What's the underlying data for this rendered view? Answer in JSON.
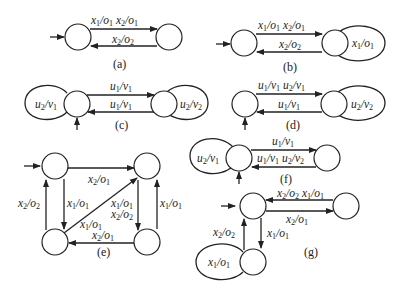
{
  "figure": {
    "subfigures": [
      {
        "id": "a",
        "caption": "(a)",
        "edges": [
          {
            "label": "x1/o1 x2/o1",
            "from": "s0",
            "to": "s1"
          },
          {
            "label": "x2/o2",
            "from": "s1",
            "to": "s0"
          }
        ]
      },
      {
        "id": "b",
        "caption": "(b)",
        "edges": [
          {
            "label": "x1/o1 x2/o1",
            "from": "s0",
            "to": "s1"
          },
          {
            "label": "x2/o2",
            "from": "s1",
            "to": "s0"
          },
          {
            "label": "x1/o1",
            "from": "s1",
            "to": "s1"
          }
        ]
      },
      {
        "id": "c",
        "caption": "(c)",
        "edges": [
          {
            "label": "u2/v1",
            "from": "s0",
            "to": "s0"
          },
          {
            "label": "u1/v1",
            "from": "s0",
            "to": "s1"
          },
          {
            "label": "u1/v1",
            "from": "s1",
            "to": "s0"
          },
          {
            "label": "u2/v2",
            "from": "s1",
            "to": "s1"
          }
        ]
      },
      {
        "id": "d",
        "caption": "(d)",
        "edges": [
          {
            "label": "u1/v1 u2/v1",
            "from": "s0",
            "to": "s1"
          },
          {
            "label": "u1/v1",
            "from": "s1",
            "to": "s0"
          },
          {
            "label": "u2/v2",
            "from": "s1",
            "to": "s1"
          }
        ]
      },
      {
        "id": "e",
        "caption": "(e)",
        "edges": [
          {
            "label": "x2/o1",
            "from": "tl",
            "to": "tr"
          },
          {
            "label": "x1/o1",
            "from": "tl",
            "to": "bl"
          },
          {
            "label": "x2/o2",
            "from": "bl",
            "to": "tl"
          },
          {
            "label": "x1/o1",
            "from": "bl",
            "to": "tr"
          },
          {
            "label": "x1/o1 x2/o2",
            "from": "tr",
            "to": "br"
          },
          {
            "label": "x1/o1",
            "from": "br",
            "to": "tr"
          },
          {
            "label": "x2/o1",
            "from": "br",
            "to": "bl"
          }
        ]
      },
      {
        "id": "f",
        "caption": "(f)",
        "edges": [
          {
            "label": "u2/v1",
            "from": "s0",
            "to": "s0"
          },
          {
            "label": "u1/v1",
            "from": "s0",
            "to": "s1"
          },
          {
            "label": "u1/v1 u2/v2",
            "from": "s1",
            "to": "s0"
          }
        ]
      },
      {
        "id": "g",
        "caption": "(g)",
        "edges": [
          {
            "label": "x2/o2 x1/o1",
            "from": "r",
            "to": "s0"
          },
          {
            "label": "x2/o1",
            "from": "s0",
            "to": "r"
          },
          {
            "label": "x1/o1",
            "from": "s0",
            "to": "b"
          },
          {
            "label": "x2/o2",
            "from": "b",
            "to": "s0"
          },
          {
            "label": "x1/o1",
            "from": "b",
            "to": "b"
          }
        ]
      }
    ]
  }
}
